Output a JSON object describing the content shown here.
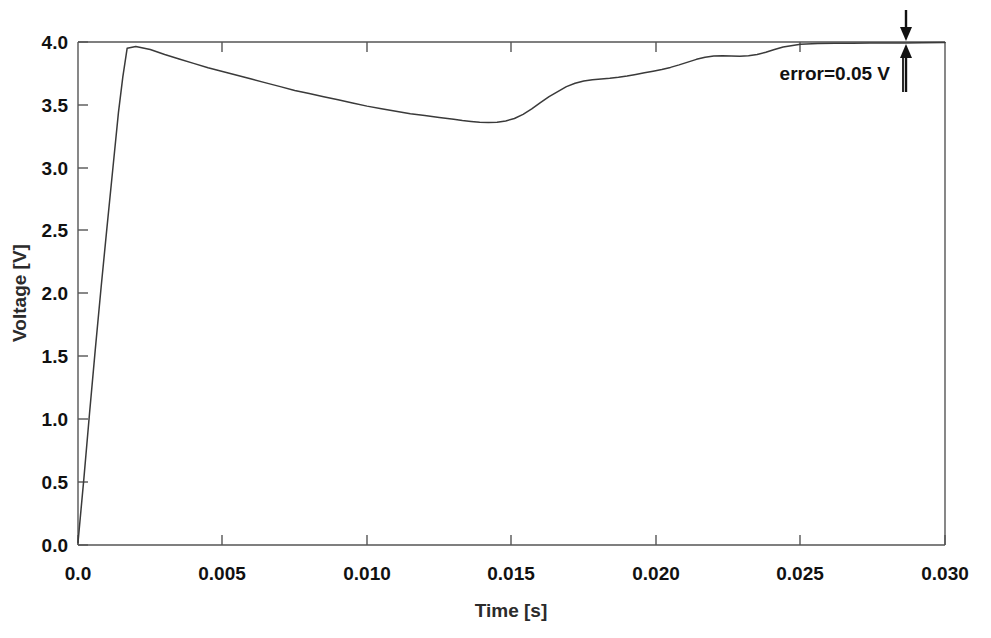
{
  "chart_data": {
    "type": "line",
    "title": "",
    "subtitle": "",
    "xlabel": "Time [s]",
    "ylabel": "Voltage [V]",
    "xlim": [
      0.0,
      0.03
    ],
    "ylim": [
      0.0,
      4.0
    ],
    "grid": false,
    "legend": null,
    "legend_position": "none",
    "xticks": [
      0.0,
      0.005,
      0.01,
      0.015,
      0.02,
      0.025,
      0.03
    ],
    "xtick_labels": [
      "0.0",
      "0.005",
      "0.010",
      "0.015",
      "0.020",
      "0.025",
      "0.030"
    ],
    "yticks": [
      0.0,
      0.5,
      1.0,
      1.5,
      2.0,
      2.5,
      3.0,
      3.5,
      4.0
    ],
    "ytick_labels": [
      "0.0",
      "0.5",
      "1.0",
      "1.5",
      "2.0",
      "2.5",
      "3.0",
      "3.5",
      "4.0"
    ],
    "series": [
      {
        "name": "Voltage",
        "color": "#3a3a3a",
        "x": [
          0.0,
          0.0002,
          0.0004,
          0.0006,
          0.0008,
          0.001,
          0.0012,
          0.0014,
          0.00155,
          0.0017,
          0.002,
          0.0025,
          0.003,
          0.0035,
          0.004,
          0.0045,
          0.005,
          0.0055,
          0.006,
          0.0065,
          0.007,
          0.0075,
          0.008,
          0.0085,
          0.009,
          0.0095,
          0.01,
          0.0105,
          0.011,
          0.0115,
          0.012,
          0.0125,
          0.013,
          0.0133,
          0.0136,
          0.0139,
          0.0142,
          0.0145,
          0.0148,
          0.0151,
          0.0154,
          0.0157,
          0.016,
          0.0163,
          0.0166,
          0.0169,
          0.0172,
          0.0175,
          0.0178,
          0.0181,
          0.0184,
          0.0187,
          0.019,
          0.0193,
          0.0196,
          0.0199,
          0.0202,
          0.0205,
          0.0208,
          0.0211,
          0.0214,
          0.0217,
          0.022,
          0.0223,
          0.0226,
          0.0229,
          0.0232,
          0.0235,
          0.0238,
          0.0241,
          0.0244,
          0.025,
          0.0256,
          0.0262,
          0.0268,
          0.0274,
          0.028,
          0.0286,
          0.0292,
          0.03
        ],
        "y": [
          0.02,
          0.52,
          1.05,
          1.56,
          2.05,
          2.52,
          2.98,
          3.44,
          3.72,
          3.95,
          3.965,
          3.94,
          3.9,
          3.865,
          3.83,
          3.795,
          3.765,
          3.735,
          3.705,
          3.675,
          3.645,
          3.615,
          3.59,
          3.565,
          3.54,
          3.515,
          3.49,
          3.47,
          3.45,
          3.43,
          3.415,
          3.4,
          3.385,
          3.375,
          3.368,
          3.362,
          3.36,
          3.362,
          3.372,
          3.392,
          3.425,
          3.468,
          3.518,
          3.565,
          3.605,
          3.645,
          3.672,
          3.69,
          3.7,
          3.706,
          3.712,
          3.72,
          3.73,
          3.742,
          3.755,
          3.768,
          3.782,
          3.798,
          3.818,
          3.84,
          3.862,
          3.878,
          3.888,
          3.89,
          3.888,
          3.886,
          3.89,
          3.9,
          3.918,
          3.94,
          3.96,
          3.982,
          3.988,
          3.99,
          3.991,
          3.992,
          3.992,
          3.993,
          3.994,
          3.996
        ]
      }
    ],
    "annotations": [
      {
        "text": "error=0.05 V",
        "x": 0.0265,
        "y": 3.78,
        "marker": "double-arrow",
        "arrow_x": 0.0285
      }
    ]
  }
}
